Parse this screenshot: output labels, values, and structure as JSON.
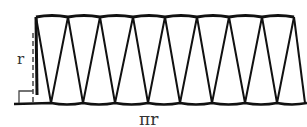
{
  "diagram": {
    "labels": {
      "height": "r",
      "base": "πr"
    },
    "top_vertices_x": [
      36,
      68,
      100,
      133,
      165,
      197,
      229,
      262,
      294
    ],
    "bottom_vertices_x": [
      51,
      83,
      115,
      148,
      180,
      212,
      245,
      277
    ],
    "top_y": 17,
    "bottom_y": 103,
    "stroke_color": "#111111"
  }
}
